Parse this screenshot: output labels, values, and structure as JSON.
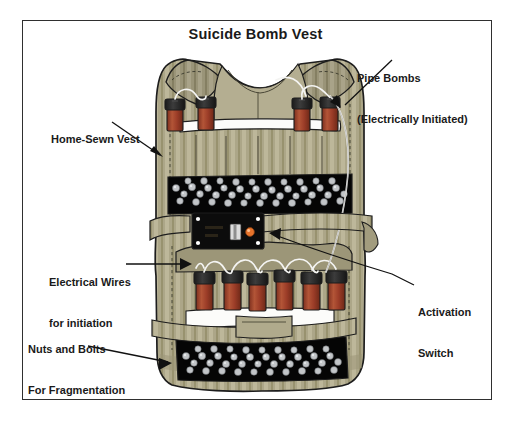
{
  "figure": {
    "title": "Suicide Bomb Vest",
    "frame_color": "#2f2f2f",
    "background_color": "#ffffff"
  },
  "callouts": [
    {
      "id": "pipe-bombs",
      "line1": "Pipe Bombs",
      "line2": "(Electrically Initiated)",
      "position": "top-right",
      "leader": "arrow pointing down-left to upper pipe bomb row"
    },
    {
      "id": "home-sewn-vest",
      "line1": "Home-Sewn Vest",
      "line2": "",
      "position": "upper-left",
      "leader": "arrow pointing down-right to vest left edge"
    },
    {
      "id": "electrical-wires",
      "line1": "Electrical Wires",
      "line2": "for initiation",
      "position": "middle-left",
      "leader": "horizontal line then arrow pointing right to wire loops"
    },
    {
      "id": "activation-switch",
      "line1": "Activation",
      "line2": "Switch",
      "position": "middle-right",
      "leader": "line running up-left to arrow at switch panel"
    },
    {
      "id": "nuts-and-bolts",
      "line1": "Nuts and Bolts",
      "line2": "For Fragmentation",
      "position": "lower-left",
      "leader": "arrow pointing down-right to bottom fragmentation pouch"
    }
  ],
  "illustration": {
    "vest": {
      "label": "home-sewn tactical vest, front view",
      "fabric_color": "#a9a384",
      "fabric_highlight": "#c3bda0",
      "fabric_shadow": "#8d8769",
      "outline_color": "#1d1d1d",
      "stitch_style": "dashed seam lines"
    },
    "pipe_bombs": {
      "upper_row_count": 4,
      "lower_row_count": 6,
      "cap_color": "#2b2b2b",
      "body_color": "#9c3d28",
      "body_highlight": "#b85a3c"
    },
    "fragmentation_pouches": {
      "count": 2,
      "pouch_color": "#000000",
      "filler_label": "nuts and bolts",
      "filler_color": "#b9bcbe",
      "filler_highlight": "#e6e8ea"
    },
    "switch_panel": {
      "label": "activation switch panel",
      "body_color": "#0d0d0d",
      "indicator_color": "#e8742c",
      "slider_color": "#d8d8d8",
      "screw_color": "#ffffff"
    },
    "wiring": {
      "label": "initiation wires",
      "color": "#f2f2f2",
      "outline": "#6a6a6a"
    },
    "straps": {
      "label": "webbing straps",
      "color": "#a9a384"
    }
  }
}
